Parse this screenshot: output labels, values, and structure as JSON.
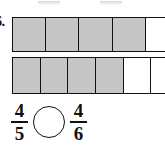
{
  "problem": {
    "number_label": "6.",
    "prompt_type": "compare-fractions"
  },
  "models": [
    {
      "name": "fifths-bar",
      "total_parts": 5,
      "shaded_parts": 4,
      "cells": [
        {
          "shaded": true
        },
        {
          "shaded": true
        },
        {
          "shaded": true
        },
        {
          "shaded": true
        },
        {
          "shaded": false
        }
      ]
    },
    {
      "name": "sixths-bar",
      "total_parts": 6,
      "shaded_parts": 4,
      "cells": [
        {
          "shaded": true
        },
        {
          "shaded": true
        },
        {
          "shaded": true
        },
        {
          "shaded": true
        },
        {
          "shaded": false
        },
        {
          "shaded": false
        }
      ]
    }
  ],
  "comparison": {
    "left_fraction": {
      "numerator": "4",
      "denominator": "5"
    },
    "operator_value": "",
    "right_fraction": {
      "numerator": "4",
      "denominator": "6"
    }
  },
  "colors": {
    "shaded_fill": "#c6c6c6",
    "unshaded_fill": "#ffffff",
    "stroke": "#111111",
    "background": "#ffffff"
  }
}
